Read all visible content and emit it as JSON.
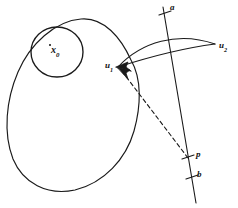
{
  "figure": {
    "kind": "hand-drawn-mathematical-diagram",
    "background_color": "#ffffff",
    "ink_color": "#1a1a1a",
    "width": 238,
    "height": 208,
    "labels": {
      "center_point": {
        "base": "x",
        "sub": "0",
        "text": "x0"
      },
      "line_top": {
        "base": "a",
        "sub": "",
        "text": "a"
      },
      "vector_right": {
        "base": "u",
        "sub": "2",
        "text": "u2"
      },
      "vector_left": {
        "base": "u",
        "sub": "1",
        "text": "u1"
      },
      "point_p": {
        "base": "p",
        "sub": "",
        "text": "p"
      },
      "line_bottom": {
        "base": "b",
        "sub": "",
        "text": "b"
      }
    },
    "shapes": {
      "outer_region": {
        "name": "large-egg-shaped-closed-curve",
        "path": "M 131 60 C 142 78 141 104 134 130 C 126 158 105 182 76 190 C 48 197 24 184 14 160 C 3 134 5 100 17 72 C 29 44 54 21 80 19 C 103 17 121 37 131 60 Z"
      },
      "inner_circle": {
        "name": "small-circle-around-x0",
        "cx": 57,
        "cy": 52,
        "rx": 26,
        "ry": 25
      },
      "lens_upper_arc": {
        "name": "upper-arc-u1-to-u2",
        "path": "M 117 67 C 140 42 178 32 215 44"
      },
      "lens_lower_arc": {
        "name": "lower-arc-u1-to-u2",
        "path": "M 117 67 C 145 57 183 48 215 44"
      },
      "transversal_line": {
        "name": "slanted-line-a-to-b",
        "x1": 163,
        "y1": 7,
        "x2": 196,
        "y2": 202
      },
      "dashed_line": {
        "name": "dashed-segment-p-to-u1",
        "x1": 188,
        "y1": 158,
        "x2": 120,
        "y2": 69,
        "dash_pattern": "4 3"
      },
      "ticks": [
        {
          "name": "tick-a",
          "x": 165,
          "y": 13
        },
        {
          "name": "tick-p",
          "x": 188,
          "y": 157
        },
        {
          "name": "tick-b",
          "x": 192,
          "y": 177
        }
      ],
      "arrowheads": [
        {
          "name": "arrowhead-at-u1-from-u2",
          "x": 117,
          "y": 67
        },
        {
          "name": "arrowhead-at-u1-from-p",
          "x": 119,
          "y": 68
        }
      ]
    }
  }
}
